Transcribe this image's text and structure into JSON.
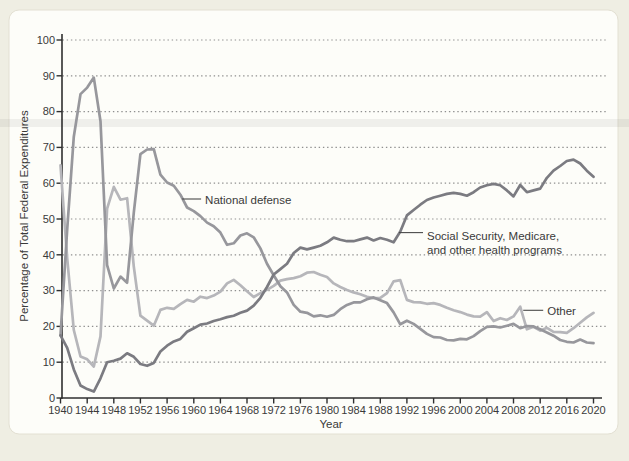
{
  "window": {
    "title": "Federal Expenditures Chart"
  },
  "colors": {
    "page_bg": "#efeee3",
    "panel_bg": "#fdfdf9",
    "panel_border": "#e3e0d3",
    "axis": "#2f2f2f",
    "tick_text": "#3a3a3a",
    "grid_dot": "#8f8f8f",
    "scan_band": "rgba(120,120,120,0.10)"
  },
  "chart_data": {
    "type": "line",
    "title": "",
    "xlabel": "Year",
    "ylabel": "Percentage of Total Federal Expenditures",
    "xlim": [
      1940,
      2020
    ],
    "ylim": [
      0,
      100
    ],
    "grid": "horizontal dotted lines at every 10",
    "legend": "inline annotations with leader lines",
    "x_ticks": [
      1940,
      1944,
      1948,
      1952,
      1956,
      1960,
      1964,
      1968,
      1972,
      1976,
      1980,
      1984,
      1988,
      1992,
      1996,
      2000,
      2004,
      2008,
      2012,
      2016,
      2020
    ],
    "y_ticks": [
      0,
      10,
      20,
      30,
      40,
      50,
      60,
      70,
      80,
      90,
      100
    ],
    "x": [
      1940,
      1941,
      1942,
      1943,
      1944,
      1945,
      1946,
      1947,
      1948,
      1949,
      1950,
      1951,
      1952,
      1953,
      1954,
      1955,
      1956,
      1957,
      1958,
      1959,
      1960,
      1961,
      1962,
      1963,
      1964,
      1965,
      1966,
      1967,
      1968,
      1969,
      1970,
      1971,
      1972,
      1973,
      1974,
      1975,
      1976,
      1977,
      1978,
      1979,
      1980,
      1981,
      1982,
      1983,
      1984,
      1985,
      1986,
      1987,
      1988,
      1989,
      1990,
      1991,
      1992,
      1993,
      1994,
      1995,
      1996,
      1997,
      1998,
      1999,
      2000,
      2001,
      2002,
      2003,
      2004,
      2005,
      2006,
      2007,
      2008,
      2009,
      2010,
      2011,
      2012,
      2013,
      2014,
      2015,
      2016,
      2017,
      2018,
      2019,
      2020
    ],
    "series": [
      {
        "id": "other",
        "name": "Other",
        "color": "#b6b6ba",
        "values": [
          65.0,
          39.0,
          19.0,
          11.6,
          10.8,
          8.8,
          17.2,
          52.9,
          59.0,
          55.4,
          55.8,
          36.7,
          23.0,
          21.6,
          20.2,
          24.6,
          25.2,
          24.9,
          26.2,
          27.4,
          26.9,
          28.3,
          27.9,
          28.6,
          29.7,
          32.0,
          33.0,
          31.5,
          29.8,
          28.2,
          29.3,
          30.2,
          31.3,
          32.8,
          33.2,
          33.5,
          34.0,
          35.0,
          35.2,
          34.4,
          33.8,
          32.0,
          31.0,
          30.2,
          29.5,
          29.0,
          28.3,
          27.9,
          28.0,
          29.3,
          32.6,
          32.9,
          27.4,
          26.8,
          26.7,
          26.3,
          26.5,
          26.0,
          25.2,
          24.5,
          24.0,
          23.3,
          22.8,
          22.7,
          24.0,
          21.5,
          22.3,
          21.8,
          22.8,
          25.5,
          19.2,
          19.9,
          18.8,
          19.6,
          18.5,
          18.4,
          18.2,
          19.5,
          21.0,
          22.5,
          23.8
        ]
      },
      {
        "id": "national-defense",
        "name": "National defense",
        "color": "#97979c",
        "values": [
          17.5,
          47.1,
          73.0,
          84.9,
          86.7,
          89.5,
          77.3,
          37.1,
          30.6,
          33.9,
          32.2,
          51.8,
          68.1,
          69.4,
          69.5,
          62.4,
          60.2,
          59.3,
          56.8,
          53.2,
          52.2,
          50.8,
          49.0,
          48.0,
          46.2,
          42.8,
          43.2,
          45.4,
          46.0,
          44.9,
          41.8,
          37.5,
          34.3,
          31.2,
          29.5,
          26.0,
          24.1,
          23.8,
          22.8,
          23.1,
          22.7,
          23.2,
          24.8,
          26.0,
          26.7,
          26.7,
          27.6,
          28.1,
          27.3,
          26.5,
          23.9,
          20.6,
          21.6,
          20.7,
          19.3,
          17.9,
          17.0,
          16.9,
          16.2,
          16.1,
          16.5,
          16.4,
          17.3,
          18.7,
          19.9,
          20.0,
          19.7,
          20.2,
          20.7,
          19.5,
          20.1,
          20.0,
          19.2,
          18.3,
          17.4,
          16.2,
          15.7,
          15.5,
          16.3,
          15.5,
          15.3
        ]
      },
      {
        "id": "social-security",
        "name": "Social Security, Medicare, and other health programs",
        "color": "#7b7b81",
        "values": [
          17.5,
          14.0,
          8.0,
          3.5,
          2.5,
          1.8,
          5.5,
          10.0,
          10.4,
          11.0,
          12.5,
          11.5,
          9.5,
          9.0,
          9.8,
          13.0,
          14.6,
          15.8,
          16.5,
          18.5,
          19.5,
          20.5,
          20.8,
          21.5,
          22.0,
          22.6,
          23.0,
          23.8,
          24.4,
          25.8,
          28.0,
          31.0,
          34.5,
          36.0,
          37.5,
          40.5,
          42.0,
          41.5,
          42.0,
          42.5,
          43.5,
          44.8,
          44.2,
          43.8,
          43.8,
          44.3,
          44.8,
          44.0,
          44.7,
          44.2,
          43.5,
          46.5,
          51.0,
          52.5,
          54.0,
          55.3,
          56.0,
          56.5,
          57.0,
          57.3,
          57.0,
          56.5,
          57.5,
          58.8,
          59.4,
          59.8,
          59.4,
          58.0,
          56.3,
          59.5,
          57.5,
          58.0,
          58.5,
          61.5,
          63.5,
          64.8,
          66.2,
          66.6,
          65.5,
          63.5,
          61.8
        ]
      }
    ],
    "annotations": [
      {
        "id": "national-defense-label",
        "lines": [
          "National defense"
        ],
        "anchor_year": 1958.25,
        "anchor_value": 55.6,
        "leader_dx": 19,
        "text_dx": 23,
        "text_dy": 4.5,
        "line_h": 14
      },
      {
        "id": "social-security-label",
        "lines": [
          "Social Security, Medicare,",
          "and other health programs"
        ],
        "anchor_year": 1990.8,
        "anchor_value": 46.2,
        "leader_dx": 24,
        "text_dx": 28,
        "text_dy": 7,
        "line_h": 14
      },
      {
        "id": "other-label",
        "lines": [
          "Other"
        ],
        "anchor_year": 2009.45,
        "anchor_value": 24.5,
        "leader_dx": 20,
        "text_dx": 24,
        "text_dy": 4.5,
        "line_h": 14
      }
    ]
  }
}
